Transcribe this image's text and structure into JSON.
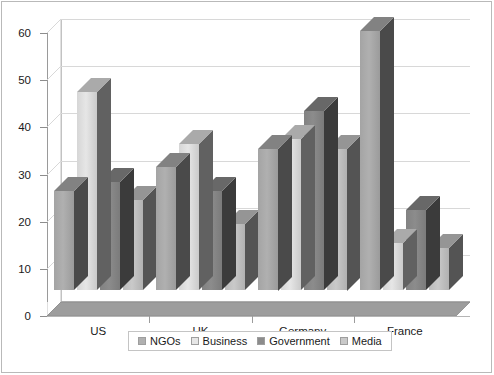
{
  "chart_data": {
    "type": "bar",
    "title": "",
    "subtitle": "",
    "xlabel": "",
    "ylabel": "",
    "categories": [
      "US",
      "UK",
      "Germany",
      "France"
    ],
    "series": [
      {
        "name": "NGOs",
        "color": "#b0b0b0",
        "values": [
          21,
          26,
          30,
          55
        ]
      },
      {
        "name": "Business",
        "color": "#e6e6e6",
        "values": [
          42,
          31,
          32,
          10
        ]
      },
      {
        "name": "Government",
        "color": "#8c8c8c",
        "values": [
          23,
          21,
          38,
          17
        ]
      },
      {
        "name": "Media",
        "color": "#c9c9c9",
        "values": [
          19,
          14,
          30,
          9
        ]
      }
    ],
    "ylim": [
      0,
      60
    ],
    "yticks": [
      0,
      10,
      20,
      30,
      40,
      50,
      60
    ],
    "ytick_labels": [
      "0",
      "10",
      "20",
      "30",
      "40",
      "50",
      "60"
    ],
    "grid": true,
    "grid_axis": "y",
    "legend_position": "bottom",
    "style": "3d-column",
    "background": "#ffffff",
    "grid_color": "#d8d8d8",
    "axis_color": "#9a9a9a",
    "floor_color": "#9d9d9d",
    "text_color": "#1a1a1a"
  }
}
